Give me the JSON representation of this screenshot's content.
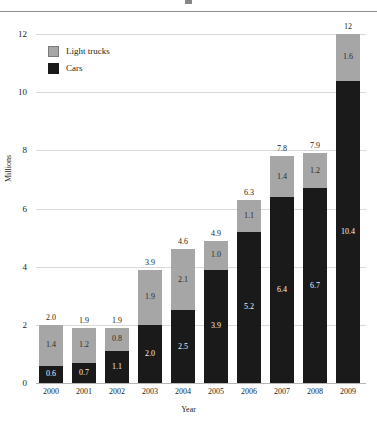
{
  "chart_data": {
    "type": "bar",
    "stacked": true,
    "title": "",
    "xlabel": "Year",
    "ylabel": "Millions",
    "categories": [
      "2000",
      "2001",
      "2002",
      "2003",
      "2004",
      "2005",
      "2006",
      "2007",
      "2008",
      "2009"
    ],
    "series": [
      {
        "name": "Cars",
        "color": "#1a1a1a",
        "values": [
          0.6,
          0.7,
          1.1,
          2.0,
          2.5,
          3.9,
          5.2,
          6.4,
          6.7,
          10.4
        ],
        "labels": [
          "0.6",
          "0.7",
          "1.1",
          "2.0",
          "2.5",
          "3.9",
          "5.2",
          "6.4",
          "6.7",
          "10.4"
        ]
      },
      {
        "name": "Light trucks",
        "color": "#a6a6a6",
        "values": [
          1.4,
          1.2,
          0.8,
          1.9,
          2.1,
          1.0,
          1.1,
          1.4,
          1.2,
          1.6
        ],
        "labels": [
          "1.4",
          "1.2",
          "0.8",
          "1.9",
          "2.1",
          "1.0",
          "1.1",
          "1.4",
          "1.2",
          "1.6"
        ]
      }
    ],
    "totals": [
      2.0,
      1.9,
      1.9,
      3.9,
      4.6,
      4.9,
      6.3,
      7.8,
      7.9,
      12.0
    ],
    "total_labels": [
      "2.0",
      "1.9",
      "1.9",
      "3.9",
      "4.6",
      "4.9",
      "6.3",
      "7.8",
      "7.9",
      "12"
    ],
    "ylim": [
      0,
      12
    ],
    "yticks": [
      0,
      2,
      4,
      6,
      8,
      10,
      12
    ],
    "ytick_labels": [
      "0",
      "2",
      "4",
      "6",
      "8",
      "10",
      "12"
    ],
    "grid": true,
    "legend_position": "top-left",
    "legend": [
      {
        "label": "Light trucks",
        "color": "#a6a6a6",
        "swatch": "truck"
      },
      {
        "label": "Cars",
        "color": "#1a1a1a",
        "swatch": "car"
      }
    ]
  }
}
